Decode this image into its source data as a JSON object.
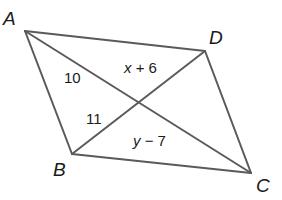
{
  "figure": {
    "type": "parallelogram-with-diagonals",
    "vertices": {
      "A": {
        "label": "A",
        "x": 25,
        "y": 31
      },
      "B": {
        "label": "B",
        "x": 72,
        "y": 154
      },
      "C": {
        "label": "C",
        "x": 251,
        "y": 173
      },
      "D": {
        "label": "D",
        "x": 205,
        "y": 51
      }
    },
    "intersection": {
      "x": 140,
      "y": 100
    },
    "segment_labels": {
      "AE": {
        "text": "10"
      },
      "BE": {
        "text": "11"
      },
      "DE": {
        "var": "x",
        "op": "+ 6"
      },
      "CE": {
        "var": "y",
        "op": "− 7"
      }
    },
    "colors": {
      "stroke": "#5a5a5a",
      "text": "#1a1a1a",
      "background": "#ffffff"
    }
  }
}
